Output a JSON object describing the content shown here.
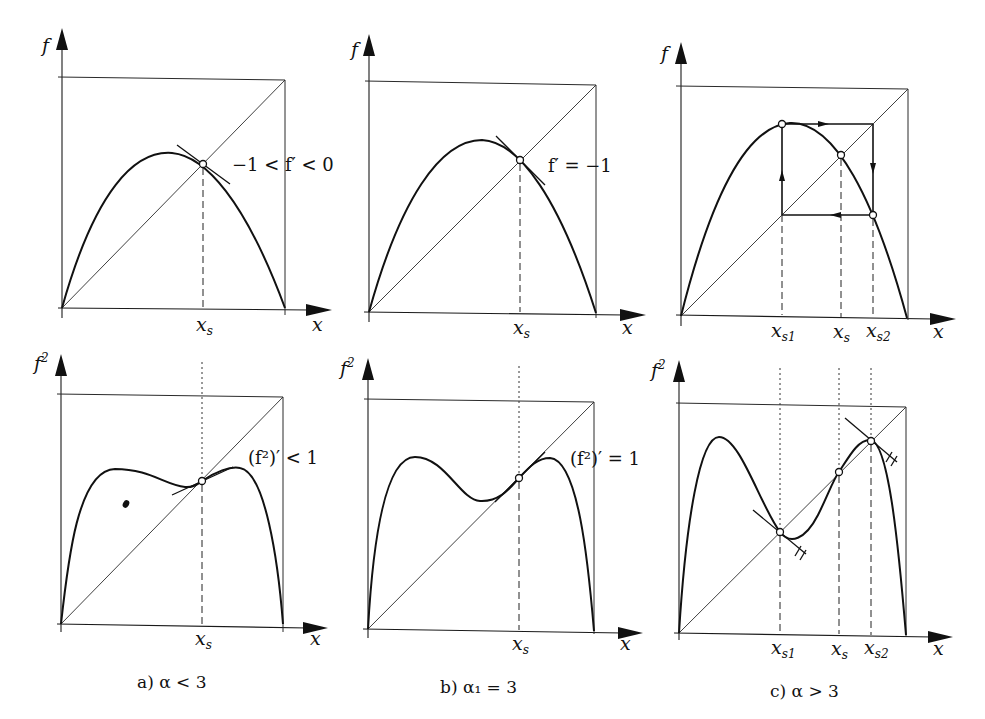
{
  "figure": {
    "panels": [
      {
        "id": "a",
        "caption": "a) α < 3",
        "top": {
          "y_label": "f",
          "x_label": "x",
          "x_ticks": [
            "x_s"
          ],
          "annotation": "−1 < f′ < 0"
        },
        "bottom": {
          "y_label": "f²",
          "x_label": "x",
          "x_ticks": [
            "x_s"
          ],
          "annotation": "(f²)′ < 1"
        }
      },
      {
        "id": "b",
        "caption": "b) α₁ = 3",
        "top": {
          "y_label": "f",
          "x_label": "x",
          "x_ticks": [
            "x_s"
          ],
          "annotation": "f′ = −1"
        },
        "bottom": {
          "y_label": "f²",
          "x_label": "x",
          "x_ticks": [
            "x_s"
          ],
          "annotation": "(f²)′ = 1"
        }
      },
      {
        "id": "c",
        "caption": "c) α > 3",
        "top": {
          "y_label": "f",
          "x_label": "x",
          "x_ticks": [
            "x_s1",
            "x_s",
            "x_s2"
          ],
          "annotation": ""
        },
        "bottom": {
          "y_label": "f²",
          "x_label": "x",
          "x_ticks": [
            "x_s1",
            "x_s",
            "x_s2"
          ],
          "annotation": ""
        }
      }
    ]
  },
  "labels": {
    "f": "f",
    "f2_base": "f",
    "f2_exp": "2",
    "x": "x",
    "x_base": "x",
    "s": "s",
    "s1": "s1",
    "s2": "s2",
    "ann_a_top": "−1 < f′ < 0",
    "ann_b_top": "f′ = −1",
    "ann_a_bot": "(f²)′ < 1",
    "ann_b_bot": "(f²)′ = 1",
    "cap_a": "a) α < 3",
    "cap_b": "b) α₁ = 3",
    "cap_c": "c) α > 3"
  }
}
